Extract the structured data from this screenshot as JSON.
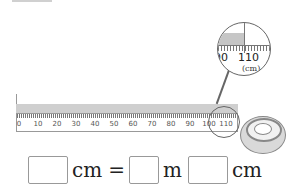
{
  "ruler": {
    "labels": [
      "0",
      "10",
      "20",
      "30",
      "40",
      "50",
      "60",
      "70",
      "80",
      "90",
      "100",
      "110"
    ],
    "unit": "cm",
    "shade_end_cm": 110
  },
  "magnifier": {
    "left_label": "90",
    "right_label": "110",
    "unit": "(cm)"
  },
  "equation": {
    "unit1": "cm",
    "equals": "=",
    "unit2": "m",
    "unit3": "cm",
    "answer_cm_total": "",
    "answer_m": "",
    "answer_cm": ""
  }
}
